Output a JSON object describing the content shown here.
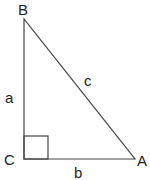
{
  "diagram": {
    "type": "right-triangle",
    "vertices": {
      "B": {
        "label": "B",
        "x": 24,
        "y": 19
      },
      "C": {
        "label": "C",
        "x": 24,
        "y": 159
      },
      "A": {
        "label": "A",
        "x": 135,
        "y": 159
      }
    },
    "sides": {
      "a": {
        "label": "a",
        "from": "B",
        "to": "C"
      },
      "b": {
        "label": "b",
        "from": "C",
        "to": "A"
      },
      "c": {
        "label": "c",
        "from": "B",
        "to": "A"
      }
    },
    "right_angle_at": "C",
    "line_color": "#444444"
  }
}
